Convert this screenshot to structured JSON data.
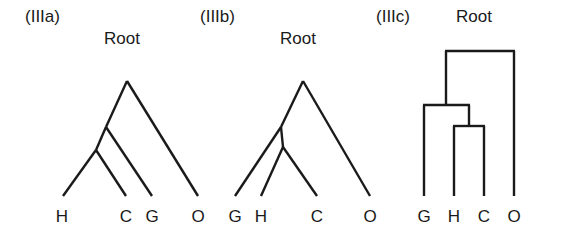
{
  "figure": {
    "background_color": "#ffffff",
    "line_color": "#1a1a1a",
    "panels": [
      {
        "id": "IIIa",
        "label": "(IIIa)",
        "label_x": 25,
        "label_y": 17,
        "root_label": "Root",
        "root_label_x": 104,
        "root_label_y": 39,
        "style": "slanted-cladogram",
        "apex": {
          "x": 127,
          "y": 81
        },
        "leaves": [
          {
            "name": "H",
            "x": 62,
            "y": 219,
            "tip_x": 63,
            "tip_y": 196
          },
          {
            "name": "C",
            "x": 126,
            "y": 219,
            "tip_x": 126,
            "tip_y": 196
          },
          {
            "name": "G",
            "x": 152,
            "y": 219,
            "tip_x": 152,
            "tip_y": 196
          },
          {
            "name": "O",
            "x": 198,
            "y": 219,
            "tip_x": 198,
            "tip_y": 196
          }
        ],
        "internal_nodes": [
          {
            "id": "n1",
            "x": 106,
            "y": 127
          },
          {
            "id": "n2",
            "x": 96,
            "y": 150
          }
        ],
        "topology": "(((H,C),G),O)"
      },
      {
        "id": "IIIb",
        "label": "(IIIb)",
        "label_x": 200,
        "label_y": 17,
        "root_label": "Root",
        "root_label_x": 280,
        "root_label_y": 39,
        "style": "slanted-cladogram",
        "apex": {
          "x": 303,
          "y": 81
        },
        "leaves": [
          {
            "name": "G",
            "x": 235,
            "y": 219,
            "tip_x": 235,
            "tip_y": 196
          },
          {
            "name": "H",
            "x": 261,
            "y": 219,
            "tip_x": 261,
            "tip_y": 196
          },
          {
            "name": "C",
            "x": 317,
            "y": 219,
            "tip_x": 317,
            "tip_y": 196
          },
          {
            "name": "O",
            "x": 370,
            "y": 219,
            "tip_x": 370,
            "tip_y": 196
          }
        ],
        "internal_nodes": [
          {
            "id": "n1",
            "x": 281,
            "y": 127
          },
          {
            "id": "n2",
            "x": 283,
            "y": 147
          }
        ],
        "topology": "((G,(H,C)),O)"
      },
      {
        "id": "IIIc",
        "label": "(IIIc)",
        "label_x": 376,
        "label_y": 17,
        "root_label": "Root",
        "root_label_x": 456,
        "root_label_y": 17,
        "style": "rectangular-cladogram",
        "bars": [
          {
            "id": "root-bar",
            "y": 51,
            "x1": 446,
            "x2": 514
          },
          {
            "id": "node1-bar",
            "y": 105,
            "x1": 424,
            "x2": 469
          },
          {
            "id": "node2-bar",
            "y": 126,
            "x1": 454,
            "x2": 484
          }
        ],
        "stems": [
          {
            "id": "root-stem",
            "x": 446,
            "y1": 51,
            "y2": 105
          },
          {
            "id": "node2-stem",
            "x": 469,
            "y1": 105,
            "y2": 126
          }
        ],
        "leaves": [
          {
            "name": "G",
            "x": 424,
            "y": 219,
            "stem_y1": 105,
            "stem_y2": 196
          },
          {
            "name": "H",
            "x": 454,
            "y": 219,
            "stem_y1": 126,
            "stem_y2": 196
          },
          {
            "name": "C",
            "x": 484,
            "y": 219,
            "stem_y1": 126,
            "stem_y2": 196
          },
          {
            "name": "O",
            "x": 514,
            "y": 219,
            "stem_y1": 51,
            "stem_y2": 196
          }
        ],
        "topology": "((G,(H,C)),O)"
      }
    ]
  }
}
